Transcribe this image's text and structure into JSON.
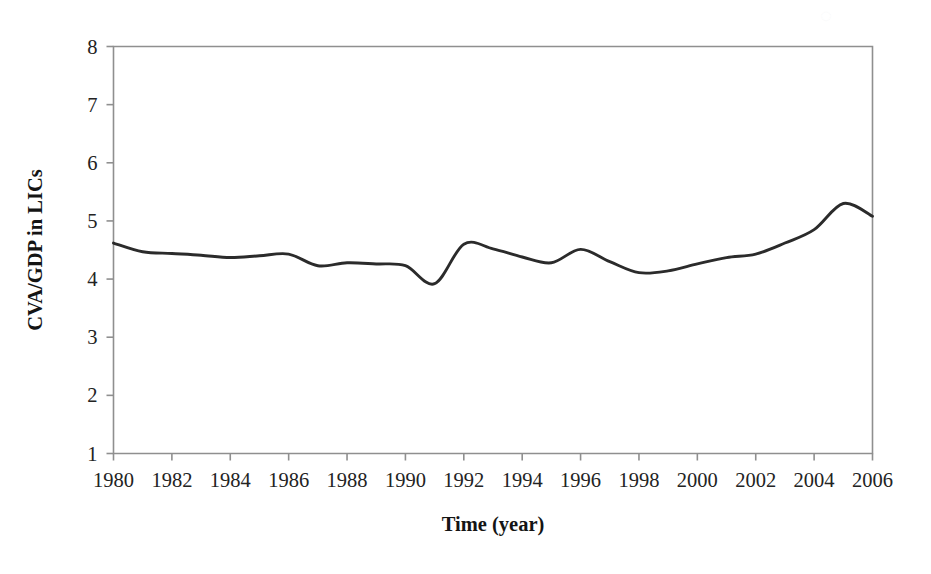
{
  "chart_data": {
    "type": "line",
    "title": "",
    "subtitle": "",
    "xlabel": "Time (year)",
    "ylabel": "CVA/GDP in LICs",
    "xlim": [
      1980,
      2006
    ],
    "ylim": [
      1,
      8
    ],
    "grid": false,
    "legend": null,
    "legend_position": "none",
    "x_tick_labels": [
      "1980",
      "1982",
      "1984",
      "1986",
      "1988",
      "1990",
      "1992",
      "1994",
      "1996",
      "1998",
      "2000",
      "2002",
      "2004",
      "2006"
    ],
    "x_tick_values": [
      1980,
      1982,
      1984,
      1986,
      1988,
      1990,
      1992,
      1994,
      1996,
      1998,
      2000,
      2002,
      2004,
      2006
    ],
    "y_tick_labels": [
      "1",
      "2",
      "3",
      "4",
      "5",
      "6",
      "7",
      "8"
    ],
    "y_tick_values": [
      1,
      2,
      3,
      4,
      5,
      6,
      7,
      8
    ],
    "line_color": "#2b2b2b",
    "background_color": "#ffffff",
    "axis_color": "#8f8f8f",
    "series": [
      {
        "name": "CVA/GDP in LICs",
        "x": [
          1980,
          1981,
          1982,
          1983,
          1984,
          1985,
          1986,
          1987,
          1988,
          1989,
          1990,
          1991,
          1992,
          1993,
          1994,
          1995,
          1996,
          1997,
          1998,
          1999,
          2000,
          2001,
          2002,
          2003,
          2004,
          2005,
          2006
        ],
        "values": [
          4.62,
          4.47,
          4.44,
          4.41,
          4.36,
          4.39,
          4.42,
          4.23,
          4.27,
          4.25,
          4.22,
          4.15,
          4.13,
          4.07,
          3.92,
          4.36,
          4.57,
          4.41,
          4.32,
          4.27,
          4.25,
          4.36,
          4.51,
          4.29,
          4.12,
          4.06,
          4.14
        ]
      }
    ],
    "series_points": [
      {
        "year": 1980,
        "value": 4.62
      },
      {
        "year": 1981,
        "value": 4.47
      },
      {
        "year": 1982,
        "value": 4.44
      },
      {
        "year": 1983,
        "value": 4.41
      },
      {
        "year": 1984,
        "value": 4.37
      },
      {
        "year": 1985,
        "value": 4.4
      },
      {
        "year": 1986,
        "value": 4.43
      },
      {
        "year": 1987,
        "value": 4.23
      },
      {
        "year": 1988,
        "value": 4.28
      },
      {
        "year": 1989,
        "value": 4.26
      },
      {
        "year": 1990,
        "value": 4.23
      },
      {
        "year": 1991,
        "value": 3.92
      },
      {
        "year": 1992,
        "value": 4.6
      },
      {
        "year": 1993,
        "value": 4.52
      },
      {
        "year": 1994,
        "value": 4.38
      },
      {
        "year": 1995,
        "value": 4.28
      },
      {
        "year": 1996,
        "value": 4.51
      },
      {
        "year": 1997,
        "value": 4.3
      },
      {
        "year": 1998,
        "value": 4.11
      },
      {
        "year": 1999,
        "value": 4.14
      },
      {
        "year": 2000,
        "value": 4.26
      },
      {
        "year": 2001,
        "value": 4.37
      },
      {
        "year": 2002,
        "value": 4.43
      },
      {
        "year": 2003,
        "value": 4.62
      },
      {
        "year": 2004,
        "value": 4.85
      },
      {
        "year": 2005,
        "value": 5.3
      },
      {
        "year": 2006,
        "value": 5.08
      }
    ]
  },
  "annotations": {
    "watermark_glyph": "◌"
  }
}
